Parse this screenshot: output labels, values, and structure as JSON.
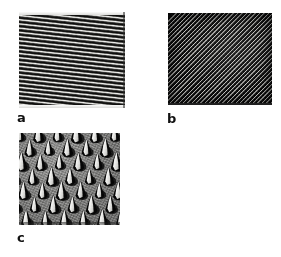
{
  "figure": {
    "background_color": "#ffffff",
    "width": 281,
    "height": 257,
    "panel_count": 3
  },
  "panels": [
    {
      "id": "a",
      "label": "a",
      "kind": "line-grating",
      "description": "Near-horizontal one-dimensional line grating with slight clockwise tilt",
      "bounds": {
        "x": 19,
        "y": 12,
        "width": 106,
        "height": 96
      },
      "tilt_degrees": 6.2,
      "period_px": 4.2,
      "colors": {
        "highlight": "#f4f4f2",
        "midtone": "#6e6e6a",
        "shadow": "#0b0b0a",
        "background": "#e8e8e6"
      }
    },
    {
      "id": "b",
      "label": "b",
      "kind": "dot-array-low-mag",
      "description": "Dense two-dimensional array of bright nanostructures in diagonal rows on a dark field",
      "bounds": {
        "x": 168,
        "y": 13,
        "width": 104,
        "height": 92
      },
      "row_angle_degrees": -45,
      "period_px": 3.1,
      "colors": {
        "background": "#0a0a0a",
        "dot_highlight": "#d6d6d2",
        "dot_midtone": "#bcbcb8"
      }
    },
    {
      "id": "c",
      "label": "c",
      "kind": "cone-array-high-mag",
      "description": "High magnification tilted view of conical nanopillars with bright illuminated facets and dark cast shadows on a grey substrate",
      "bounds": {
        "x": 19,
        "y": 133,
        "width": 101,
        "height": 92
      },
      "rows": 7,
      "columns": 6,
      "cone_width_px": 13,
      "cone_height_px": 19,
      "colors": {
        "substrate": "#8b8b89",
        "cone_facet_highlight": "#ffffff",
        "cone_body_shadow": "#060606"
      }
    }
  ],
  "labels": {
    "a": "a",
    "b": "b",
    "c": "c"
  }
}
